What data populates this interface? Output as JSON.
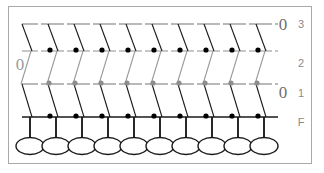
{
  "figure": {
    "kind": "trellis-lattice-diagram",
    "width": 324,
    "height": 173,
    "background": "#ffffff",
    "border_color": "#a9a9a9"
  },
  "levels": [
    {
      "id": "3",
      "label": "3",
      "row": 0,
      "line_y": 24,
      "stroke": "#808080",
      "edge_stroke": "#1a1a1a",
      "edge_direction": "down-right",
      "dot_color": "#000000",
      "dot_count": 9,
      "edge_count": 10,
      "end_marker": "0",
      "end_marker_side": "right"
    },
    {
      "id": "2",
      "label": "2",
      "row": 1,
      "line_y": 51,
      "stroke": "#9a9a9a",
      "edge_stroke": "#9a9a9a",
      "edge_direction": "up-right",
      "dot_color": "#8d8d8d",
      "dot_count": 9,
      "edge_count": 10,
      "end_marker": "0",
      "end_marker_side": "left"
    },
    {
      "id": "1",
      "label": "1",
      "row": 2,
      "line_y": 84,
      "stroke": "#808080",
      "edge_stroke": "#1a1a1a",
      "edge_direction": "down-right",
      "dot_color": "#000000",
      "dot_count": 9,
      "edge_count": 10,
      "end_marker": "0",
      "end_marker_side": "right"
    },
    {
      "id": "F",
      "label": "F",
      "row": 3,
      "line_y": 117,
      "stroke": "#1a1a1a",
      "edge_stroke": "#1a1a1a",
      "edge_direction": "vertical",
      "dot_color": null,
      "dot_count": 0,
      "edge_count": 10,
      "end_marker": null,
      "end_marker_side": null
    }
  ],
  "columns": {
    "count": 10,
    "x_positions": [
      30,
      56,
      82,
      108,
      134,
      160,
      186,
      212,
      238,
      264
    ],
    "spacing": 26
  },
  "nodes": {
    "count": 10,
    "row_y": 146,
    "rx": 14,
    "ry": 8.5,
    "stroke": "#1a1a1a",
    "fill": "#ffffff",
    "x_positions": [
      30,
      56,
      82,
      108,
      134,
      160,
      186,
      212,
      238,
      264
    ]
  },
  "stems": {
    "count": 10,
    "from_y": 117,
    "to_y": 138,
    "stroke": "#1a1a1a"
  },
  "end_markers": [
    {
      "level": "3",
      "text": "0",
      "x": 283,
      "y": 30,
      "color": "#6e6e6e"
    },
    {
      "level": "2",
      "text": "0",
      "x": 20,
      "y": 70,
      "color": "#9a9a9a"
    },
    {
      "level": "1",
      "text": "0",
      "x": 283,
      "y": 98,
      "color": "#6e6e6e"
    }
  ],
  "labels": {
    "color": "#8a8a8a",
    "items": [
      {
        "text": "3",
        "x": 301,
        "y": 24
      },
      {
        "text": "2",
        "x": 301,
        "y": 63
      },
      {
        "text": "1",
        "x": 301,
        "y": 93
      },
      {
        "text": "F",
        "x": 301,
        "y": 122
      }
    ]
  }
}
